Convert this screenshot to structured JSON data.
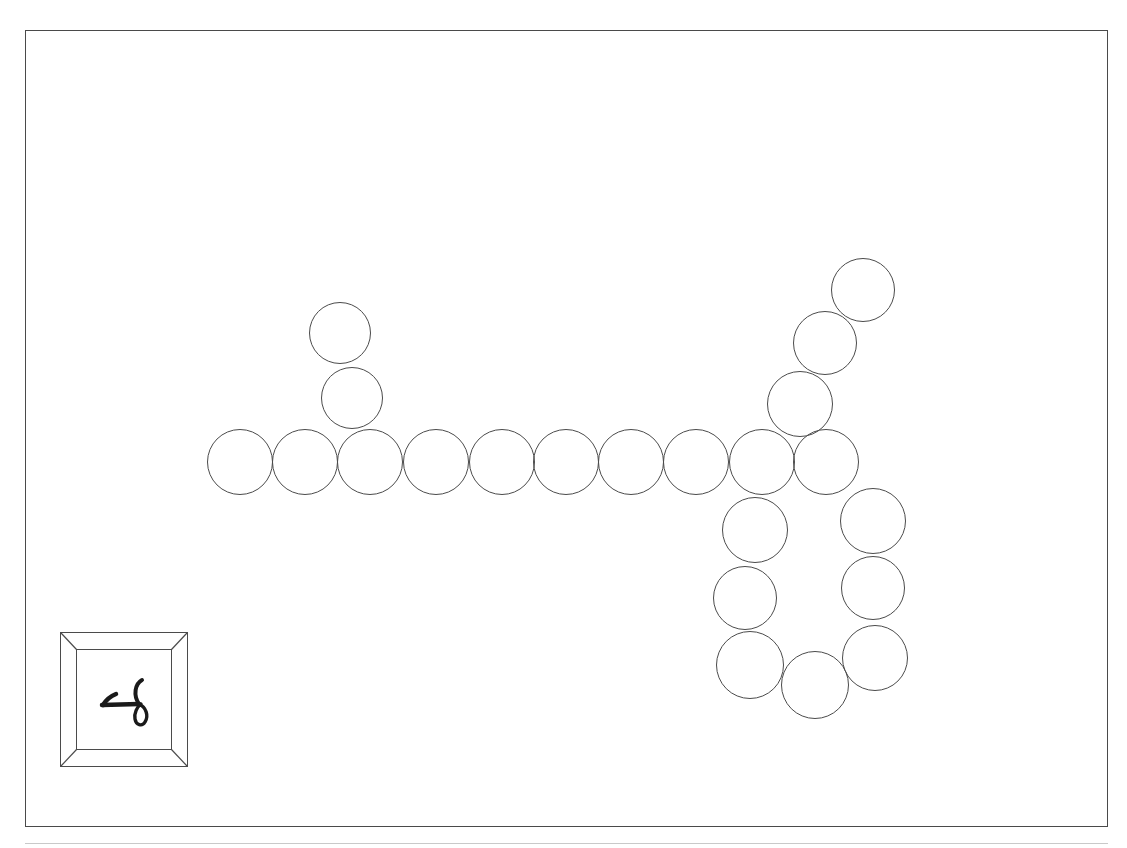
{
  "page": {
    "title": "Bead chain drawing",
    "background_color": "#ffffff",
    "width": 1127,
    "height": 848
  },
  "sheet": {
    "name": "sheet-border",
    "stroke_color": "#4a4a4a",
    "left": 25,
    "top": 30,
    "width": 1083,
    "height": 797
  },
  "footer_rule": {
    "stroke_color": "#c9c9c9",
    "left": 25,
    "top": 843,
    "width": 1083
  },
  "bead_chain": {
    "label": "bead chain",
    "stroke_color": "#4b4b4b",
    "fill_color": "transparent",
    "count": 26,
    "beads": [
      {
        "name": "bead-stem-top",
        "cx": 340,
        "cy": 333,
        "r": 31
      },
      {
        "name": "bead-stem-lower",
        "cx": 352,
        "cy": 398,
        "r": 31
      },
      {
        "name": "bead-row-1",
        "cx": 240,
        "cy": 462,
        "r": 33
      },
      {
        "name": "bead-row-2",
        "cx": 305,
        "cy": 462,
        "r": 33
      },
      {
        "name": "bead-row-3",
        "cx": 370,
        "cy": 462,
        "r": 33
      },
      {
        "name": "bead-row-4",
        "cx": 436,
        "cy": 462,
        "r": 33
      },
      {
        "name": "bead-row-5",
        "cx": 502,
        "cy": 462,
        "r": 33
      },
      {
        "name": "bead-row-6",
        "cx": 566,
        "cy": 462,
        "r": 33
      },
      {
        "name": "bead-row-7",
        "cx": 631,
        "cy": 462,
        "r": 33
      },
      {
        "name": "bead-row-8",
        "cx": 696,
        "cy": 462,
        "r": 33
      },
      {
        "name": "bead-row-9",
        "cx": 762,
        "cy": 462,
        "r": 33
      },
      {
        "name": "bead-row-10",
        "cx": 826,
        "cy": 462,
        "r": 33
      },
      {
        "name": "bead-diag-1",
        "cx": 800,
        "cy": 404,
        "r": 33
      },
      {
        "name": "bead-diag-2",
        "cx": 825,
        "cy": 343,
        "r": 32
      },
      {
        "name": "bead-diag-3",
        "cx": 863,
        "cy": 290,
        "r": 32
      },
      {
        "name": "bead-loop-left-1",
        "cx": 755,
        "cy": 530,
        "r": 33
      },
      {
        "name": "bead-loop-left-2",
        "cx": 745,
        "cy": 598,
        "r": 32
      },
      {
        "name": "bead-loop-left-3",
        "cx": 750,
        "cy": 665,
        "r": 34
      },
      {
        "name": "bead-loop-bottom-1",
        "cx": 815,
        "cy": 685,
        "r": 34
      },
      {
        "name": "bead-loop-right-3",
        "cx": 875,
        "cy": 658,
        "r": 33
      },
      {
        "name": "bead-loop-right-2",
        "cx": 873,
        "cy": 588,
        "r": 32
      },
      {
        "name": "bead-loop-right-1",
        "cx": 873,
        "cy": 521,
        "r": 33
      }
    ]
  },
  "glyph_card": {
    "name": "framed-glyph",
    "frame_stroke_color": "#4b4b4b",
    "glyph_color": "#1a1a1a",
    "description": "handwritten mark inside a beveled square frame",
    "left": 60,
    "top": 632,
    "width": 128,
    "height": 135
  }
}
